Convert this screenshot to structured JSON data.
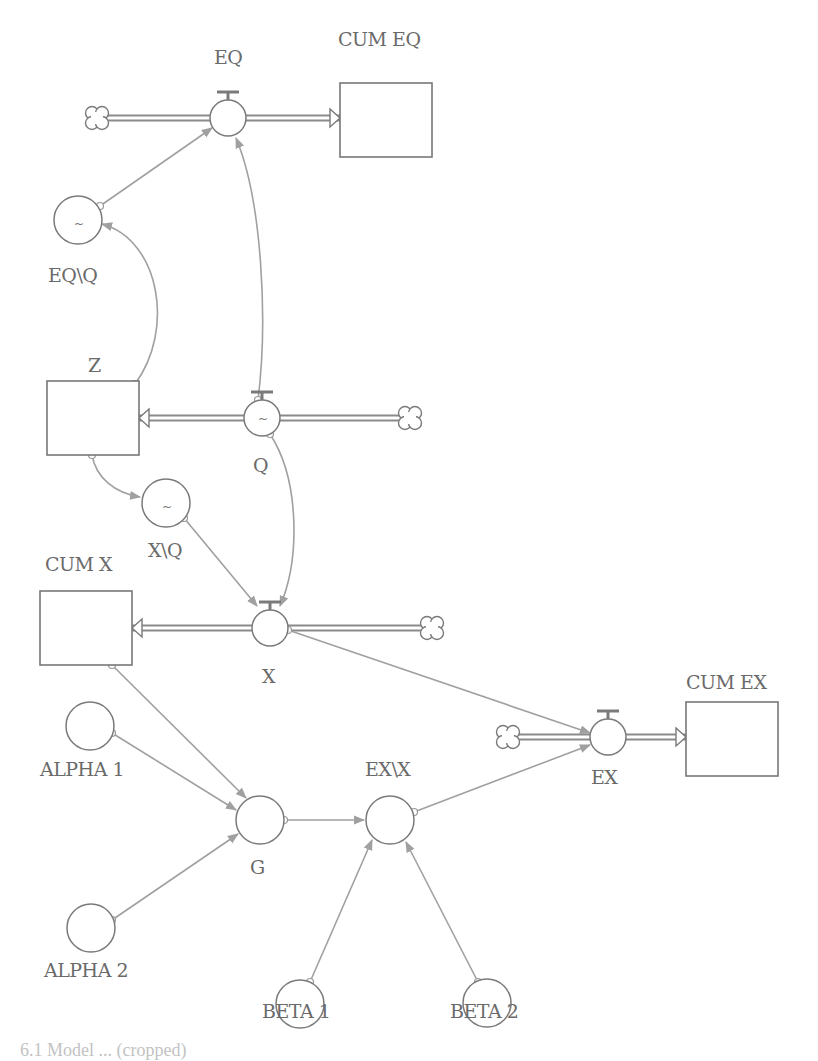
{
  "diagram": {
    "type": "stock-and-flow",
    "stocks": [
      {
        "id": "cum-eq",
        "label": "CUM EQ",
        "x": 340,
        "y": 83,
        "w": 92,
        "h": 74,
        "lx": 338,
        "ly": 46
      },
      {
        "id": "z",
        "label": "Z",
        "x": 47,
        "y": 381,
        "w": 92,
        "h": 74,
        "lx": 88,
        "ly": 372
      },
      {
        "id": "cum-x",
        "label": "CUM X",
        "x": 40,
        "y": 591,
        "w": 92,
        "h": 74,
        "lx": 45,
        "ly": 571
      },
      {
        "id": "cum-ex",
        "label": "CUM EX",
        "x": 686,
        "y": 702,
        "w": 92,
        "h": 74,
        "lx": 686,
        "ly": 689
      }
    ],
    "flows": [
      {
        "id": "eq",
        "label": "EQ",
        "cx": 228,
        "cy": 118,
        "r": 18,
        "lx": 214,
        "ly": 64,
        "pipe": [
          96,
          118,
          340,
          118
        ],
        "arrow_dir": "right",
        "cloud": [
          97,
          118
        ],
        "tilde": false
      },
      {
        "id": "q",
        "label": "Q",
        "cx": 262,
        "cy": 418,
        "r": 18,
        "lx": 253,
        "ly": 472,
        "pipe": [
          139,
          418,
          412,
          418
        ],
        "arrow_dir": "left",
        "cloud": [
          410,
          418
        ],
        "tilde": true
      },
      {
        "id": "x",
        "label": "X",
        "cx": 270,
        "cy": 628,
        "r": 18,
        "lx": 262,
        "ly": 683,
        "pipe": [
          132,
          628,
          432,
          628
        ],
        "arrow_dir": "left",
        "cloud": [
          432,
          628
        ],
        "tilde": false
      },
      {
        "id": "ex",
        "label": "EX",
        "cx": 608,
        "cy": 737,
        "r": 18,
        "lx": 591,
        "ly": 784,
        "pipe": [
          516,
          737,
          686,
          737
        ],
        "arrow_dir": "right",
        "cloud": [
          508,
          737
        ],
        "tilde": false
      }
    ],
    "converters": [
      {
        "id": "eq-q",
        "label": "EQ\\Q",
        "cx": 78,
        "cy": 220,
        "r": 24,
        "lx": 48,
        "ly": 282,
        "tilde": true
      },
      {
        "id": "x-q",
        "label": "X\\Q",
        "cx": 166,
        "cy": 503,
        "r": 24,
        "lx": 148,
        "ly": 557,
        "tilde": true
      },
      {
        "id": "alpha-1",
        "label": "ALPHA 1",
        "cx": 90,
        "cy": 726,
        "r": 24,
        "lx": 40,
        "ly": 776,
        "tilde": false
      },
      {
        "id": "alpha-2",
        "label": "ALPHA 2",
        "cx": 91,
        "cy": 928,
        "r": 24,
        "lx": 44,
        "ly": 977,
        "tilde": false
      },
      {
        "id": "g",
        "label": "G",
        "cx": 260,
        "cy": 820,
        "r": 24,
        "lx": 250,
        "ly": 874,
        "tilde": false
      },
      {
        "id": "ex-x",
        "label": "EX\\X",
        "cx": 390,
        "cy": 820,
        "r": 24,
        "lx": 365,
        "ly": 776,
        "tilde": false
      },
      {
        "id": "beta-1",
        "label": "BETA 1",
        "cx": 300,
        "cy": 1004,
        "r": 24,
        "lx": 262,
        "ly": 1018,
        "tilde": false
      },
      {
        "id": "beta-2",
        "label": "BETA 2",
        "cx": 487,
        "cy": 1003,
        "r": 24,
        "lx": 450,
        "ly": 1018,
        "tilde": false
      }
    ],
    "connectors": [
      {
        "id": "eqq-to-eq",
        "d": "M 100 206 L 212 128"
      },
      {
        "id": "q-to-eq",
        "d": "M 258 400 C 268 320, 262 200, 236 138"
      },
      {
        "id": "z-to-eqq",
        "d": "M 135 384 C 175 330, 160 240, 102 224"
      },
      {
        "id": "z-to-xq",
        "d": "M 92 455 C 96 478, 115 493, 140 497"
      },
      {
        "id": "xq-to-x",
        "d": "M 184 518 L 257 606"
      },
      {
        "id": "q-to-x",
        "d": "M 270 434 C 300 480, 300 560, 280 606"
      },
      {
        "id": "x-to-ex",
        "d": "M 288 630 L 590 733"
      },
      {
        "id": "cumx-to-g",
        "d": "M 112 665 L 246 798"
      },
      {
        "id": "alpha1-to-g",
        "d": "M 112 733 L 236 810"
      },
      {
        "id": "alpha2-to-g",
        "d": "M 112 920 L 238 834"
      },
      {
        "id": "g-to-exx",
        "d": "M 284 820 L 364 820"
      },
      {
        "id": "exx-to-ex",
        "d": "M 414 812 L 590 745"
      },
      {
        "id": "beta1-to-exx",
        "d": "M 310 982 L 372 840"
      },
      {
        "id": "beta2-to-exx",
        "d": "M 478 982 L 406 842"
      }
    ],
    "colors": {
      "stroke": "#777777",
      "connector": "#a0a0a0",
      "label": "#6a6a6a",
      "background": "#ffffff"
    }
  },
  "caption": {
    "text": "6.1 Model ... (cropped)"
  }
}
